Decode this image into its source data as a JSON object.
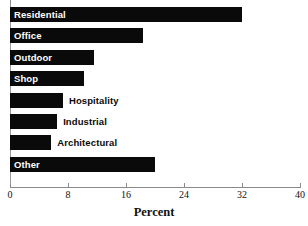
{
  "chart_data": {
    "type": "bar",
    "orientation": "horizontal",
    "title": "",
    "xlabel": "Percent",
    "ylabel": "",
    "xlim": [
      0,
      40
    ],
    "xticks": [
      0,
      8,
      16,
      24,
      32,
      40
    ],
    "xtick_labels": [
      "0",
      "8",
      "16",
      "24",
      "32",
      "40"
    ],
    "grid": false,
    "legend": false,
    "bar_color": "#0a0a0a",
    "categories": [
      "Residential",
      "Office",
      "Outdoor",
      "Shop",
      "Hospitality",
      "Industrial",
      "Architectural",
      "Other"
    ],
    "values": [
      32,
      18.3,
      11.6,
      10.2,
      7.3,
      6.5,
      5.7,
      20
    ],
    "label_placement": [
      "inside",
      "inside",
      "inside",
      "inside",
      "outside",
      "outside",
      "outside",
      "inside"
    ]
  },
  "axis": {
    "title": "Percent",
    "ticks": [
      "0",
      "8",
      "16",
      "24",
      "32",
      "40"
    ]
  },
  "bars": [
    {
      "label": "Residential",
      "value": 32,
      "placement": "inside"
    },
    {
      "label": "Office",
      "value": 18.3,
      "placement": "inside"
    },
    {
      "label": "Outdoor",
      "value": 11.6,
      "placement": "inside"
    },
    {
      "label": "Shop",
      "value": 10.2,
      "placement": "inside"
    },
    {
      "label": "Hospitality",
      "value": 7.3,
      "placement": "outside"
    },
    {
      "label": "Industrial",
      "value": 6.5,
      "placement": "outside"
    },
    {
      "label": "Architectural",
      "value": 5.7,
      "placement": "outside"
    },
    {
      "label": "Other",
      "value": 20,
      "placement": "inside"
    }
  ]
}
